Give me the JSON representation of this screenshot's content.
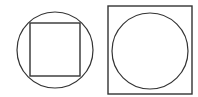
{
  "diagram": {
    "stroke_color": "#333333",
    "background": "#ffffff",
    "figures": [
      {
        "name": "square-in-circle",
        "outer": {
          "shape": "circle",
          "cx": 55,
          "cy": 50,
          "r": 38
        },
        "inner": {
          "shape": "square",
          "x": 30,
          "y": 23,
          "width": 50,
          "height": 53
        }
      },
      {
        "name": "circle-in-square",
        "outer": {
          "shape": "square",
          "x": 108,
          "y": 6,
          "width": 84,
          "height": 88
        },
        "inner": {
          "shape": "circle",
          "cx": 150,
          "cy": 51,
          "r": 38
        }
      }
    ]
  }
}
